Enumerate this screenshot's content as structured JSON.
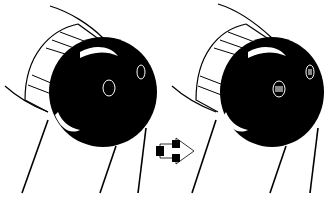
{
  "figure": {
    "panels": [
      {
        "id": "before",
        "label": "",
        "ball_color": "#000000",
        "holes": "empty-outlined"
      },
      {
        "id": "after",
        "label": "",
        "ball_color": "#000000",
        "holes": "filled-inserts"
      }
    ],
    "arrow": {
      "direction": "right",
      "meaning": "transition"
    },
    "colors": {
      "ink": "#000000",
      "background": "#ffffff"
    }
  }
}
